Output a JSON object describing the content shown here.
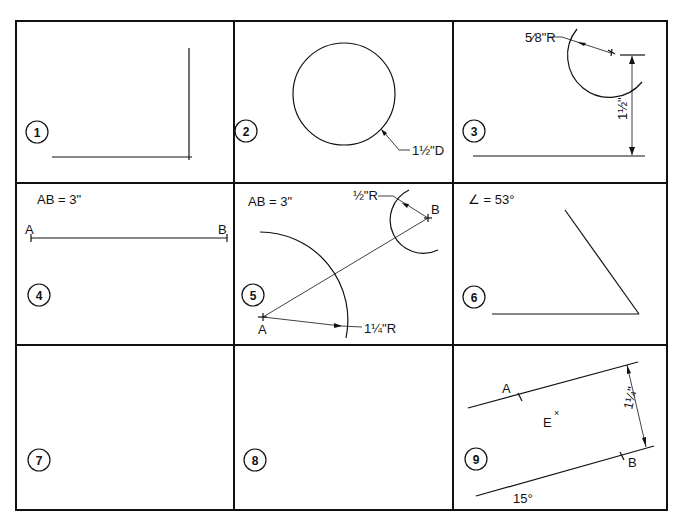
{
  "grid": {
    "rows": 3,
    "cols": 3,
    "line_color": "#111111",
    "background": "#ffffff"
  },
  "cells": [
    {
      "number": "1",
      "labels": {}
    },
    {
      "number": "2",
      "labels": {
        "diameter": "1½\"D"
      }
    },
    {
      "number": "3",
      "labels": {
        "radius": "5⁄8\"R",
        "distance": "1½\""
      }
    },
    {
      "number": "4",
      "labels": {
        "spec": "AB = 3\"",
        "point_a": "A",
        "point_b": "B"
      }
    },
    {
      "number": "5",
      "labels": {
        "spec": "AB = 3\"",
        "radius_b": "½\"R",
        "point_b": "B",
        "point_a": "A",
        "radius_a": "1¼\"R"
      }
    },
    {
      "number": "6",
      "labels": {
        "spec": "∠ = 53°"
      }
    },
    {
      "number": "7",
      "labels": {}
    },
    {
      "number": "8",
      "labels": {}
    },
    {
      "number": "9",
      "labels": {
        "point_a": "A",
        "point_b": "B",
        "point_e": "E",
        "distance": "1¼\"",
        "angle": "15°"
      }
    }
  ]
}
